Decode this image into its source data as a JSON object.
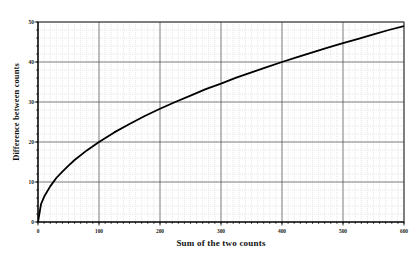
{
  "chart_data": {
    "type": "line",
    "title": "",
    "xlabel": "Sum of the two counts",
    "ylabel": "Difference between counts",
    "xlim": [
      0,
      600
    ],
    "ylim": [
      0,
      50
    ],
    "xticks": [
      0,
      100,
      200,
      300,
      400,
      500,
      600
    ],
    "yticks": [
      0,
      10,
      20,
      30,
      40,
      50
    ],
    "xtick_labels": [
      "0",
      "100",
      "200",
      "300",
      "400",
      "500",
      "600"
    ],
    "ytick_labels": [
      "0",
      "10",
      "20",
      "30",
      "40",
      "50"
    ],
    "x_minor_step": 10,
    "y_minor_step": 2,
    "grid": "major solid, minor dotted",
    "legend": null,
    "series": [
      {
        "name": "Difference between counts",
        "color": "#000000",
        "x": [
          0,
          5,
          10,
          20,
          30,
          40,
          50,
          60,
          80,
          100,
          125,
          150,
          175,
          200,
          225,
          250,
          275,
          300,
          325,
          350,
          375,
          400,
          425,
          450,
          475,
          500,
          525,
          550,
          575,
          600
        ],
        "y": [
          0,
          4.5,
          6.3,
          8.9,
          11.0,
          12.6,
          14.1,
          15.5,
          17.9,
          20.0,
          22.4,
          24.5,
          26.5,
          28.3,
          30.0,
          31.6,
          33.2,
          34.6,
          36.1,
          37.4,
          38.7,
          40.0,
          41.2,
          42.4,
          43.6,
          44.7,
          45.8,
          46.9,
          48.0,
          49.0
        ]
      }
    ]
  },
  "axis": {
    "x_title": "Sum of the two counts",
    "y_title": "Difference between counts"
  }
}
